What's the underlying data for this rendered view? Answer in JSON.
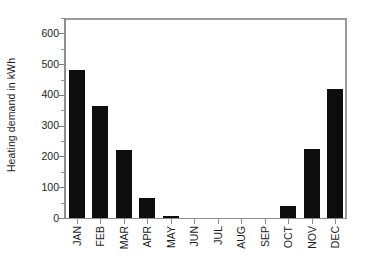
{
  "chart_data": {
    "type": "bar",
    "title": "",
    "subtitle": "",
    "xlabel": "",
    "ylabel": "Heating demand in kWh",
    "categories": [
      "JAN",
      "FEB",
      "MAR",
      "APR",
      "MAY",
      "JUN",
      "JUL",
      "AUG",
      "SEP",
      "OCT",
      "NOV",
      "DEC"
    ],
    "values": [
      480,
      365,
      220,
      65,
      5,
      0,
      0,
      0,
      0,
      38,
      225,
      420
    ],
    "ylim": [
      0,
      650
    ],
    "xlim_categories": 12,
    "y_major_ticks": [
      0,
      100,
      200,
      300,
      400,
      500,
      600
    ],
    "y_minor_ticks": [
      50,
      150,
      250,
      350,
      450,
      550,
      650
    ],
    "y_tick_labels": [
      "0",
      "100",
      "200",
      "300",
      "400",
      "500",
      "600"
    ],
    "grid": "horizontal-dashed",
    "legend": "none",
    "legend_position": "none",
    "bar_color": "#0d0d0d",
    "grid_color": "#c9c9c9",
    "axis_color": "#8d8d8d",
    "frame_color": "#9a9a9a",
    "background_color": "#ffffff",
    "x_label_rotation_degrees": 90,
    "annotations": []
  },
  "axes": {
    "y_title": "Heating demand in kWh"
  }
}
